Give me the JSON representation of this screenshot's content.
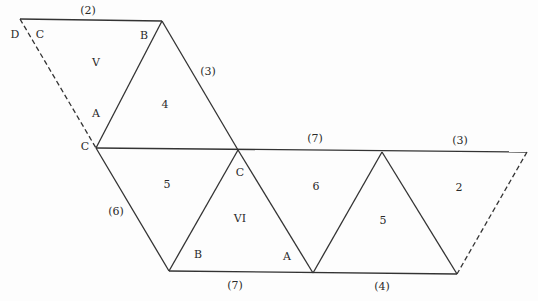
{
  "diagram": {
    "type": "polyhedron-net",
    "stroke_color": "#333333",
    "background": "#fdfdfd",
    "vertices": {
      "D": [
        20,
        19
      ],
      "T": [
        162,
        21
      ],
      "CL": [
        96,
        148
      ],
      "M": [
        238,
        150
      ],
      "R1": [
        382,
        152
      ],
      "RE": [
        527,
        152
      ],
      "BL": [
        169,
        271
      ],
      "BM": [
        313,
        273
      ],
      "BR": [
        457,
        274
      ]
    },
    "solid_edges": [
      [
        "D",
        "T"
      ],
      [
        "T",
        "CL"
      ],
      [
        "T",
        "M"
      ],
      [
        "CL",
        "RE"
      ],
      [
        "CL",
        "BL"
      ],
      [
        "BL",
        "M"
      ],
      [
        "M",
        "BM"
      ],
      [
        "BM",
        "R1"
      ],
      [
        "R1",
        "BR"
      ],
      [
        "BL",
        "BR"
      ]
    ],
    "dashed_edges": [
      [
        "D",
        "CL"
      ],
      [
        "RE",
        "BR"
      ]
    ],
    "face_labels": [
      {
        "text": "V",
        "x": 96,
        "y": 62
      },
      {
        "text": "4",
        "x": 165,
        "y": 104
      },
      {
        "text": "5",
        "x": 167,
        "y": 184
      },
      {
        "text": "VI",
        "x": 240,
        "y": 218
      },
      {
        "text": "6",
        "x": 316,
        "y": 186
      },
      {
        "text": "5",
        "x": 383,
        "y": 220
      },
      {
        "text": "2",
        "x": 459,
        "y": 187
      }
    ],
    "vertex_labels": [
      {
        "text": "D",
        "x": 15,
        "y": 34
      },
      {
        "text": "C",
        "x": 40,
        "y": 34
      },
      {
        "text": "B",
        "x": 144,
        "y": 35
      },
      {
        "text": "A",
        "x": 96,
        "y": 113
      },
      {
        "text": "C",
        "x": 85,
        "y": 146
      },
      {
        "text": "C",
        "x": 240,
        "y": 172
      },
      {
        "text": "B",
        "x": 198,
        "y": 254
      },
      {
        "text": "A",
        "x": 287,
        "y": 256
      }
    ],
    "edge_labels": [
      {
        "text": "(2)",
        "x": 88,
        "y": 10
      },
      {
        "text": "(3)",
        "x": 208,
        "y": 71
      },
      {
        "text": "(7)",
        "x": 315,
        "y": 138
      },
      {
        "text": "(3)",
        "x": 460,
        "y": 140
      },
      {
        "text": "(6)",
        "x": 116,
        "y": 211
      },
      {
        "text": "(7)",
        "x": 235,
        "y": 285
      },
      {
        "text": "(4)",
        "x": 382,
        "y": 286
      }
    ]
  }
}
